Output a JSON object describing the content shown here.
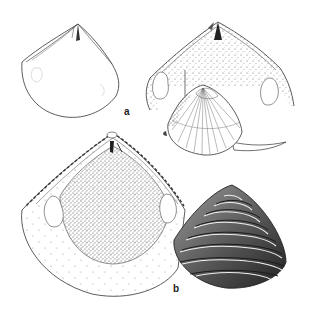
{
  "figure": {
    "kind": "scientific line illustration",
    "labels": {
      "a": "a",
      "b": "b"
    },
    "specimens": [
      {
        "group": "a",
        "view": "interior valve outline (unshaded)",
        "position": "top-left"
      },
      {
        "group": "a",
        "view": "interior valve, stippled, with muscle scars",
        "position": "top-right"
      },
      {
        "group": "a",
        "view": "exterior valve with radial ribs and siphon",
        "position": "center-right"
      },
      {
        "group": "b",
        "view": "interior valve, stippled, with crenulated hinge margin",
        "position": "bottom-left"
      },
      {
        "group": "b",
        "view": "exterior valve with concentric ridges, dark shading",
        "position": "bottom-right"
      }
    ],
    "colors": {
      "ink": "#222222",
      "paper": "#ffffff",
      "shade_dark": "#3a3a3a",
      "shade_mid": "#8a8a8a"
    }
  }
}
